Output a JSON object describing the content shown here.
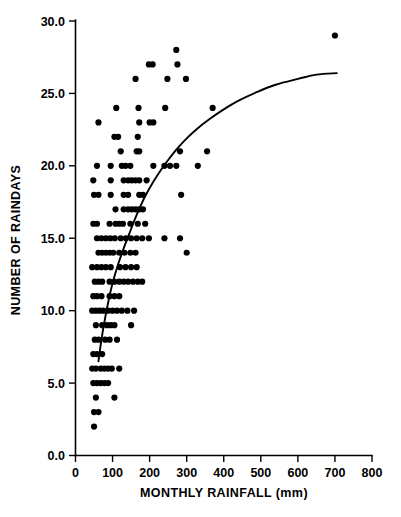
{
  "chart_data": {
    "type": "scatter",
    "title": "",
    "subtitle": "",
    "xlabel": "MONTHLY RAINFALL (mm)",
    "ylabel": "NUMBER OF RAINDAYS",
    "xlim": [
      0,
      800
    ],
    "ylim": [
      0,
      30
    ],
    "xticks": [
      0,
      100,
      200,
      300,
      400,
      500,
      600,
      700,
      800
    ],
    "xtick_labels": [
      "0",
      "100",
      "200",
      "300",
      "400",
      "500",
      "600",
      "700",
      "800"
    ],
    "yticks": [
      0,
      5,
      10,
      15,
      20,
      25,
      30
    ],
    "ytick_labels": [
      "0.0",
      "5.0",
      "10.0",
      "15.0",
      "20.0",
      "25.0",
      "30.0"
    ],
    "grid": false,
    "legend": null,
    "legend_position": "none",
    "marker": "filled-circle",
    "marker_color": "#000000",
    "marker_size_px": 3.1,
    "series": [
      {
        "name": "observations",
        "points": [
          [
            50,
            2
          ],
          [
            50,
            3
          ],
          [
            62,
            3
          ],
          [
            55,
            4
          ],
          [
            105,
            4
          ],
          [
            48,
            5
          ],
          [
            58,
            5
          ],
          [
            68,
            5
          ],
          [
            78,
            5
          ],
          [
            88,
            5
          ],
          [
            45,
            6
          ],
          [
            55,
            6
          ],
          [
            68,
            6
          ],
          [
            78,
            6
          ],
          [
            88,
            6
          ],
          [
            98,
            6
          ],
          [
            118,
            6
          ],
          [
            48,
            7
          ],
          [
            58,
            7
          ],
          [
            72,
            7
          ],
          [
            52,
            8
          ],
          [
            62,
            8
          ],
          [
            80,
            8
          ],
          [
            92,
            8
          ],
          [
            112,
            8
          ],
          [
            55,
            9
          ],
          [
            72,
            9
          ],
          [
            85,
            9
          ],
          [
            95,
            9
          ],
          [
            105,
            9
          ],
          [
            150,
            9
          ],
          [
            45,
            10
          ],
          [
            55,
            10
          ],
          [
            65,
            10
          ],
          [
            75,
            10
          ],
          [
            88,
            10
          ],
          [
            100,
            10
          ],
          [
            112,
            10
          ],
          [
            125,
            10
          ],
          [
            140,
            10
          ],
          [
            158,
            10
          ],
          [
            48,
            11
          ],
          [
            58,
            11
          ],
          [
            70,
            11
          ],
          [
            92,
            11
          ],
          [
            105,
            11
          ],
          [
            118,
            11
          ],
          [
            52,
            12
          ],
          [
            62,
            12
          ],
          [
            72,
            12
          ],
          [
            92,
            12
          ],
          [
            105,
            12
          ],
          [
            118,
            12
          ],
          [
            130,
            12
          ],
          [
            142,
            12
          ],
          [
            155,
            12
          ],
          [
            168,
            12
          ],
          [
            180,
            12
          ],
          [
            45,
            13
          ],
          [
            58,
            13
          ],
          [
            70,
            13
          ],
          [
            82,
            13
          ],
          [
            95,
            13
          ],
          [
            120,
            13
          ],
          [
            135,
            13
          ],
          [
            150,
            13
          ],
          [
            165,
            13
          ],
          [
            62,
            14
          ],
          [
            72,
            14
          ],
          [
            82,
            14
          ],
          [
            92,
            14
          ],
          [
            102,
            14
          ],
          [
            118,
            14
          ],
          [
            132,
            14
          ],
          [
            148,
            14
          ],
          [
            162,
            14
          ],
          [
            300,
            14
          ],
          [
            58,
            15
          ],
          [
            70,
            15
          ],
          [
            82,
            15
          ],
          [
            94,
            15
          ],
          [
            106,
            15
          ],
          [
            122,
            15
          ],
          [
            136,
            15
          ],
          [
            150,
            15
          ],
          [
            165,
            15
          ],
          [
            180,
            15
          ],
          [
            198,
            15
          ],
          [
            240,
            15
          ],
          [
            282,
            15
          ],
          [
            48,
            16
          ],
          [
            58,
            16
          ],
          [
            92,
            16
          ],
          [
            108,
            16
          ],
          [
            118,
            16
          ],
          [
            128,
            16
          ],
          [
            148,
            16
          ],
          [
            168,
            16
          ],
          [
            188,
            16
          ],
          [
            130,
            17
          ],
          [
            142,
            17
          ],
          [
            152,
            17
          ],
          [
            162,
            17
          ],
          [
            172,
            17
          ],
          [
            182,
            17
          ],
          [
            108,
            17
          ],
          [
            50,
            18
          ],
          [
            62,
            18
          ],
          [
            95,
            18
          ],
          [
            130,
            18
          ],
          [
            142,
            18
          ],
          [
            172,
            18
          ],
          [
            182,
            18
          ],
          [
            285,
            18
          ],
          [
            48,
            19
          ],
          [
            95,
            19
          ],
          [
            130,
            19
          ],
          [
            142,
            19
          ],
          [
            152,
            19
          ],
          [
            162,
            19
          ],
          [
            172,
            19
          ],
          [
            192,
            19
          ],
          [
            58,
            20
          ],
          [
            95,
            20
          ],
          [
            125,
            20
          ],
          [
            135,
            20
          ],
          [
            148,
            20
          ],
          [
            210,
            20
          ],
          [
            240,
            20
          ],
          [
            255,
            20
          ],
          [
            272,
            20
          ],
          [
            330,
            20
          ],
          [
            122,
            21
          ],
          [
            165,
            21
          ],
          [
            172,
            21
          ],
          [
            282,
            21
          ],
          [
            355,
            21
          ],
          [
            105,
            22
          ],
          [
            115,
            22
          ],
          [
            168,
            22
          ],
          [
            62,
            23
          ],
          [
            172,
            23
          ],
          [
            200,
            23
          ],
          [
            210,
            23
          ],
          [
            110,
            24
          ],
          [
            170,
            24
          ],
          [
            242,
            24
          ],
          [
            370,
            24
          ],
          [
            162,
            26
          ],
          [
            248,
            26
          ],
          [
            298,
            26
          ],
          [
            198,
            27
          ],
          [
            208,
            27
          ],
          [
            275,
            27
          ],
          [
            272,
            28
          ],
          [
            700,
            29
          ]
        ]
      }
    ],
    "fit_curve": {
      "name": "fitted logarithmic trend",
      "style": "solid-black-line",
      "points": [
        [
          62,
          6.5
        ],
        [
          70,
          8.0
        ],
        [
          80,
          9.5
        ],
        [
          90,
          10.8
        ],
        [
          100,
          11.9
        ],
        [
          115,
          13.2
        ],
        [
          130,
          14.3
        ],
        [
          145,
          15.3
        ],
        [
          160,
          16.3
        ],
        [
          175,
          17.2
        ],
        [
          190,
          18.0
        ],
        [
          210,
          18.9
        ],
        [
          230,
          19.7
        ],
        [
          250,
          20.4
        ],
        [
          275,
          21.2
        ],
        [
          300,
          21.9
        ],
        [
          330,
          22.6
        ],
        [
          360,
          23.2
        ],
        [
          400,
          23.9
        ],
        [
          440,
          24.5
        ],
        [
          490,
          25.1
        ],
        [
          540,
          25.6
        ],
        [
          600,
          26.0
        ],
        [
          650,
          26.3
        ],
        [
          705,
          26.4
        ]
      ]
    }
  }
}
